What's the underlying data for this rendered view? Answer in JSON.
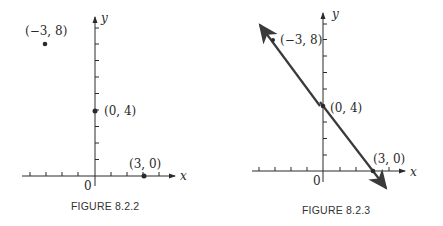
{
  "figures": [
    {
      "caption": "FIGURE 8.2.2",
      "x_axis_label": "x",
      "y_axis_label": "y",
      "origin_label": "0",
      "points": [
        {
          "label": "(−3, 8)",
          "x": -3,
          "y": 8
        },
        {
          "label": "(0, 4)",
          "x": 0,
          "y": 4
        },
        {
          "label": "(3, 0)",
          "x": 3,
          "y": 0
        }
      ]
    },
    {
      "caption": "FIGURE 8.2.3",
      "x_axis_label": "x",
      "y_axis_label": "y",
      "origin_label": "0",
      "points": [
        {
          "label": "(−3, 8)",
          "x": -3,
          "y": 8
        },
        {
          "label": "(0, 4)",
          "x": 0,
          "y": 4
        },
        {
          "label": "(3, 0)",
          "x": 3,
          "y": 0
        }
      ],
      "line": {
        "through": "(-3,8),(0,4),(3,0)",
        "equation": "y = -4/3 x + 4",
        "arrows": "both"
      }
    }
  ],
  "colors": {
    "ink": "#2a2a2a",
    "line": "#3a3a3a"
  }
}
